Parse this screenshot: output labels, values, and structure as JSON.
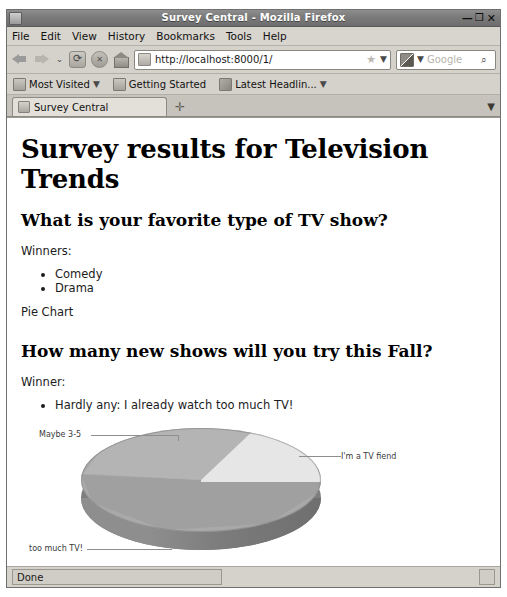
{
  "window": {
    "title": "Survey Central - Mozilla Firefox",
    "minimize_label": "—",
    "maximize_label": "❐",
    "close_label": "✕"
  },
  "menubar": {
    "items": [
      {
        "label": "File"
      },
      {
        "label": "Edit"
      },
      {
        "label": "View"
      },
      {
        "label": "History"
      },
      {
        "label": "Bookmarks"
      },
      {
        "label": "Tools"
      },
      {
        "label": "Help"
      }
    ]
  },
  "navbar": {
    "url": "http://localhost:8000/1/",
    "star": "★",
    "url_dropdown": "▼",
    "engine_dropdown": "▼",
    "search_placeholder": "Google",
    "magnifier": "⌕"
  },
  "bookmarks": {
    "items": [
      {
        "label": "Most Visited",
        "caret": "▼"
      },
      {
        "label": "Getting Started",
        "caret": ""
      },
      {
        "label": "Latest Headlin...",
        "caret": "▼"
      }
    ]
  },
  "tabs": {
    "items": [
      {
        "label": "Survey Central"
      }
    ],
    "new_tab": "✛",
    "tab_list_caret": "▼"
  },
  "page": {
    "h1": "Survey results for Television Trends",
    "section1": {
      "heading": "What is your favorite type of TV show?",
      "winners_label": "Winners:",
      "winners": [
        "Comedy",
        "Drama"
      ],
      "caption": "Pie Chart"
    },
    "section2": {
      "heading": "How many new shows will you try this Fall?",
      "winner_label": "Winner:",
      "winners": [
        "Hardly any: I already watch too much TV!"
      ]
    }
  },
  "chart_data": {
    "type": "pie",
    "title": "",
    "categories": [
      "I'm a TV fiend",
      "Maybe 3-5",
      "too much TV!"
    ],
    "values": [
      18,
      22,
      60
    ],
    "labels": [
      "I'm a TV fiend",
      "Maybe 3-5",
      "too much TV!"
    ],
    "colors": [
      "#e6e6e6",
      "#b4b4b4",
      "#a0a0a0"
    ],
    "three_d": true,
    "legend": "none",
    "annotations": [
      "Maybe 3-5",
      "I'm a TV fiend",
      "too much TV!"
    ]
  },
  "statusbar": {
    "text": "Done"
  }
}
